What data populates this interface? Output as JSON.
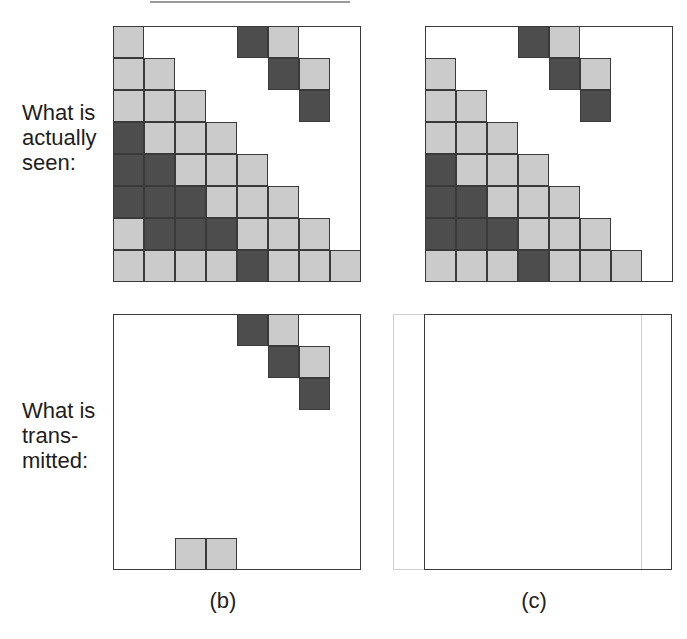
{
  "labels": {
    "seen": [
      "What is",
      "actually",
      "seen:"
    ],
    "transmitted": [
      "What is",
      "trans-",
      "mitted:"
    ]
  },
  "captions": {
    "b": "(b)",
    "c": "(c)"
  },
  "colors": {
    "light_cell": "#cbcbcb",
    "dark_cell": "#4d4d4d",
    "border": "#3a3a3a",
    "ghost_frame": "#d0d0d0"
  },
  "grid": {
    "cell_w": 31,
    "cell_h": 32,
    "cols": 8,
    "rows": 8
  },
  "panels": [
    {
      "id": "seen-b",
      "left": 113,
      "top": 26,
      "col_offset": 0,
      "cells": [
        [
          0,
          0,
          "L"
        ],
        [
          0,
          4,
          "D"
        ],
        [
          0,
          5,
          "L"
        ],
        [
          1,
          0,
          "L"
        ],
        [
          1,
          1,
          "L"
        ],
        [
          1,
          5,
          "D"
        ],
        [
          1,
          6,
          "L"
        ],
        [
          2,
          0,
          "L"
        ],
        [
          2,
          1,
          "L"
        ],
        [
          2,
          2,
          "L"
        ],
        [
          2,
          6,
          "D"
        ],
        [
          3,
          0,
          "D"
        ],
        [
          3,
          1,
          "L"
        ],
        [
          3,
          2,
          "L"
        ],
        [
          3,
          3,
          "L"
        ],
        [
          4,
          0,
          "D"
        ],
        [
          4,
          1,
          "D"
        ],
        [
          4,
          2,
          "L"
        ],
        [
          4,
          3,
          "L"
        ],
        [
          4,
          4,
          "L"
        ],
        [
          5,
          0,
          "D"
        ],
        [
          5,
          1,
          "D"
        ],
        [
          5,
          2,
          "D"
        ],
        [
          5,
          3,
          "L"
        ],
        [
          5,
          4,
          "L"
        ],
        [
          5,
          5,
          "L"
        ],
        [
          6,
          0,
          "L"
        ],
        [
          6,
          1,
          "D"
        ],
        [
          6,
          2,
          "D"
        ],
        [
          6,
          3,
          "D"
        ],
        [
          6,
          4,
          "L"
        ],
        [
          6,
          5,
          "L"
        ],
        [
          6,
          6,
          "L"
        ],
        [
          7,
          0,
          "L"
        ],
        [
          7,
          1,
          "L"
        ],
        [
          7,
          2,
          "L"
        ],
        [
          7,
          3,
          "L"
        ],
        [
          7,
          4,
          "D"
        ],
        [
          7,
          5,
          "L"
        ],
        [
          7,
          6,
          "L"
        ],
        [
          7,
          7,
          "L"
        ]
      ]
    },
    {
      "id": "seen-c",
      "left": 425,
      "top": 26,
      "col_offset": -1,
      "cells": [
        [
          0,
          4,
          "D"
        ],
        [
          0,
          5,
          "L"
        ],
        [
          1,
          1,
          "L"
        ],
        [
          1,
          5,
          "D"
        ],
        [
          1,
          6,
          "L"
        ],
        [
          2,
          1,
          "L"
        ],
        [
          2,
          2,
          "L"
        ],
        [
          2,
          6,
          "D"
        ],
        [
          3,
          1,
          "L"
        ],
        [
          3,
          2,
          "L"
        ],
        [
          3,
          3,
          "L"
        ],
        [
          4,
          1,
          "D"
        ],
        [
          4,
          2,
          "L"
        ],
        [
          4,
          3,
          "L"
        ],
        [
          4,
          4,
          "L"
        ],
        [
          5,
          1,
          "D"
        ],
        [
          5,
          2,
          "D"
        ],
        [
          5,
          3,
          "L"
        ],
        [
          5,
          4,
          "L"
        ],
        [
          5,
          5,
          "L"
        ],
        [
          6,
          1,
          "D"
        ],
        [
          6,
          2,
          "D"
        ],
        [
          6,
          3,
          "D"
        ],
        [
          6,
          4,
          "L"
        ],
        [
          6,
          5,
          "L"
        ],
        [
          6,
          6,
          "L"
        ],
        [
          7,
          1,
          "L"
        ],
        [
          7,
          2,
          "L"
        ],
        [
          7,
          3,
          "L"
        ],
        [
          7,
          4,
          "D"
        ],
        [
          7,
          5,
          "L"
        ],
        [
          7,
          6,
          "L"
        ],
        [
          7,
          7,
          "L"
        ]
      ]
    },
    {
      "id": "transmitted-b",
      "left": 113,
      "top": 314,
      "col_offset": 0,
      "cells": [
        [
          0,
          4,
          "D"
        ],
        [
          0,
          5,
          "L"
        ],
        [
          1,
          5,
          "D"
        ],
        [
          1,
          6,
          "L"
        ],
        [
          2,
          6,
          "D"
        ],
        [
          7,
          2,
          "L"
        ],
        [
          7,
          3,
          "L"
        ]
      ]
    },
    {
      "id": "transmitted-c",
      "left": 424,
      "top": 314,
      "col_offset": 0,
      "ghost_frame": {
        "left": 393,
        "top": 314
      },
      "cells": []
    }
  ]
}
